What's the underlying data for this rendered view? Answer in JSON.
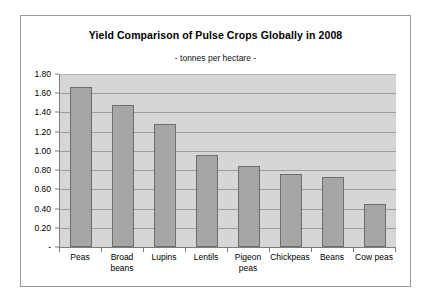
{
  "chart_data": {
    "type": "bar",
    "title": "Yield Comparison of Pulse Crops Globally in 2008",
    "subtitle": "- tonnes per hectare -",
    "xlabel": "",
    "ylabel": "",
    "categories": [
      "Peas",
      "Broad beans",
      "Lupins",
      "Lentils",
      "Pigeon peas",
      "Chickpeas",
      "Beans",
      "Cow peas"
    ],
    "category_lines": [
      [
        "Peas"
      ],
      [
        "Broad",
        "beans"
      ],
      [
        "Lupins"
      ],
      [
        "Lentils"
      ],
      [
        "Pigeon",
        "peas"
      ],
      [
        "Chickpeas"
      ],
      [
        "Beans"
      ],
      [
        "Cow peas"
      ]
    ],
    "values": [
      1.67,
      1.48,
      1.28,
      0.96,
      0.84,
      0.76,
      0.73,
      0.45
    ],
    "ylim": [
      0,
      1.8
    ],
    "ytick_values": [
      1.8,
      1.6,
      1.4,
      1.2,
      1.0,
      0.8,
      0.6,
      0.4,
      0.2,
      0
    ],
    "ytick_labels": [
      "1.80",
      "1.60",
      "1.40",
      "1.20",
      "1.00",
      "0.80",
      "0.60",
      "0.40",
      "0.20",
      "-"
    ],
    "grid": true,
    "legend": false,
    "legend_position": "none",
    "colors": {
      "bar_fill": "#a6a6a6",
      "bar_border": "#6e6e6e",
      "plot_background": "#d6d6d6",
      "gridline": "#9d9d9d",
      "axis": "#7d7d7d",
      "frame_border": "#9a9a9a",
      "text": "#000000",
      "page_background": "#ffffff"
    }
  }
}
